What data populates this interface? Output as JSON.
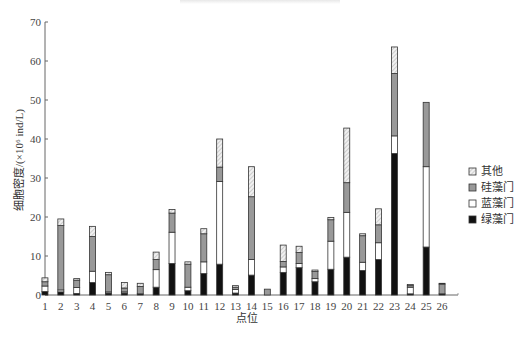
{
  "chart_data": {
    "type": "bar",
    "stacked": true,
    "title": "",
    "xlabel": "点位",
    "ylabel": "细胞密度/(×10⁶ ind/L)",
    "ylim": [
      0,
      70
    ],
    "yticks": [
      0,
      10,
      20,
      30,
      40,
      50,
      60,
      70
    ],
    "grid": false,
    "legend_position": "right",
    "categories": [
      "1",
      "2",
      "3",
      "4",
      "5",
      "6",
      "7",
      "8",
      "9",
      "10",
      "11",
      "12",
      "13",
      "14",
      "15",
      "16",
      "17",
      "18",
      "19",
      "20",
      "21",
      "22",
      "23",
      "24",
      "25",
      "26"
    ],
    "series": [
      {
        "name": "绿藻门",
        "fill": "#111111",
        "values": [
          0.9,
          0.8,
          0.4,
          3.2,
          0.5,
          0.5,
          0.3,
          2.0,
          8.1,
          1.1,
          5.5,
          7.9,
          0.5,
          5.1,
          0.0,
          5.8,
          7.0,
          3.4,
          6.6,
          9.7,
          6.3,
          9.1,
          36.3,
          0.3,
          12.3,
          0.3
        ]
      },
      {
        "name": "蓝藻门",
        "fill": "#ffffff",
        "values": [
          1.4,
          0.5,
          1.5,
          2.9,
          0.3,
          0.3,
          0.0,
          4.5,
          8.0,
          0.9,
          3.0,
          21.2,
          0.9,
          4.0,
          0.0,
          1.4,
          1.1,
          0.8,
          7.2,
          11.5,
          2.1,
          4.3,
          4.5,
          1.7,
          20.6,
          0.0
        ]
      },
      {
        "name": "硅藻门",
        "fill": "#999999",
        "values": [
          1.1,
          16.5,
          1.9,
          8.9,
          4.4,
          1.0,
          1.9,
          2.6,
          4.9,
          5.9,
          7.2,
          3.7,
          0.6,
          16.1,
          1.5,
          1.4,
          2.8,
          1.8,
          5.5,
          7.6,
          6.8,
          4.6,
          16.0,
          0.4,
          16.5,
          2.5
        ]
      },
      {
        "name": "其他",
        "fill": "hatch",
        "values": [
          1.0,
          1.7,
          0.4,
          2.6,
          0.6,
          1.4,
          0.8,
          1.9,
          0.9,
          0.6,
          1.3,
          7.2,
          0.4,
          7.7,
          0.0,
          4.2,
          1.6,
          0.4,
          0.6,
          14.0,
          0.5,
          4.1,
          6.8,
          0.3,
          0.0,
          0.2
        ]
      }
    ]
  },
  "legend": {
    "items": [
      {
        "label": "其他"
      },
      {
        "label": "硅藻门"
      },
      {
        "label": "蓝藻门"
      },
      {
        "label": "绿藻门"
      }
    ]
  }
}
